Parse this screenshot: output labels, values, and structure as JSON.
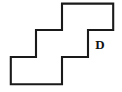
{
  "figure": {
    "kind": "polyomino-net-diagram",
    "canvas": {
      "width": 122,
      "height": 92,
      "background": "#ffffff"
    },
    "grid": {
      "cell_width": 26,
      "cell_height": 27,
      "origin_x": 10,
      "origin_y": 3,
      "columns": 4,
      "rows": 3,
      "column_edges_px": [
        10,
        36,
        62,
        88,
        114
      ],
      "row_edges_px": [
        3,
        30,
        57,
        85
      ]
    },
    "stroke": {
      "outline_color": "#1a1a1a",
      "outline_width": 2.1,
      "inner_color": "#8c8c8c",
      "inner_width": 1.05,
      "inner_dark_color": "#3a3a3a"
    },
    "cells": [
      {
        "id": "cell-r0c2",
        "row": 0,
        "col": 2,
        "x": 62,
        "y": 3,
        "w": 26,
        "h": 27
      },
      {
        "id": "cell-r0c3",
        "row": 0,
        "col": 3,
        "x": 88,
        "y": 3,
        "w": 26,
        "h": 27
      },
      {
        "id": "cell-r1c1",
        "row": 1,
        "col": 1,
        "x": 36,
        "y": 30,
        "w": 26,
        "h": 27
      },
      {
        "id": "cell-r1c2",
        "row": 1,
        "col": 2,
        "x": 62,
        "y": 30,
        "w": 26,
        "h": 27
      },
      {
        "id": "cell-r2c0",
        "row": 2,
        "col": 0,
        "x": 10,
        "y": 57,
        "w": 26,
        "h": 28
      },
      {
        "id": "cell-r2c1",
        "row": 2,
        "col": 1,
        "x": 36,
        "y": 57,
        "w": 26,
        "h": 28
      }
    ],
    "outline_path": "M 62,3 L 114,3 L 114,30 L 88,30 L 88,57 L 62,57 L 62,85 L 10,85 L 10,57 L 36,57 L 36,30 L 62,30 Z",
    "interior_segments": [
      {
        "id": "seg-v-88-top",
        "x1": 88,
        "y1": 3,
        "x2": 88,
        "y2": 30,
        "shade": "light"
      },
      {
        "id": "seg-h-62-88",
        "x1": 62,
        "y1": 30,
        "x2": 88,
        "y2": 30,
        "shade": "light"
      },
      {
        "id": "seg-v-62-mid",
        "x1": 62,
        "y1": 30,
        "x2": 62,
        "y2": 57,
        "shade": "dark"
      },
      {
        "id": "seg-h-36-62",
        "x1": 36,
        "y1": 57,
        "x2": 62,
        "y2": 57,
        "shade": "light"
      },
      {
        "id": "seg-v-36-bot",
        "x1": 36,
        "y1": 57,
        "x2": 36,
        "y2": 85,
        "shade": "light"
      }
    ],
    "labels": [
      {
        "id": "label-D",
        "text": "D",
        "x": 100,
        "y": 45,
        "font_size": 13,
        "font_weight": "bold",
        "font_style": "serif",
        "color": "#111111"
      }
    ]
  }
}
